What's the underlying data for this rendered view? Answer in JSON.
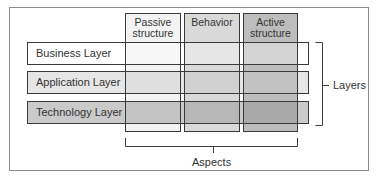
{
  "diagram": {
    "columns": [
      {
        "label": "Passive structure",
        "line1": "Passive",
        "line2": "structure",
        "fill": "#f4f4f4"
      },
      {
        "label": "Behavior",
        "line1": "Behavior",
        "line2": "",
        "fill": "#d9d9d9"
      },
      {
        "label": "Active structure",
        "line1": "Active",
        "line2": "structure",
        "fill": "#bcbcbc"
      }
    ],
    "rows": [
      {
        "label": "Business Layer",
        "fill": "#ffffff"
      },
      {
        "label": "Application Layer",
        "fill": "#e4e4e4"
      },
      {
        "label": "Technology Layer",
        "fill": "#c8c8c8"
      }
    ],
    "layers_label": "Layers",
    "aspects_label": "Aspects",
    "colors": {
      "frame_border": "#8a8a8a",
      "line": "#3a3a3a"
    }
  }
}
